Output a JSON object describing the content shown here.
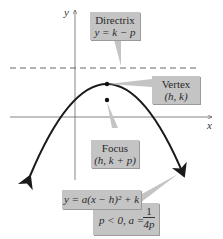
{
  "axes": {
    "x_label": "x",
    "y_label": "y"
  },
  "labels": {
    "directrix": {
      "title": "Directrix",
      "eq": "y = k − p"
    },
    "vertex": {
      "title": "Vertex",
      "coords": "(h, k)"
    },
    "focus": {
      "title": "Focus",
      "coords": "(h, k + p)"
    },
    "equation": {
      "main": "y = a(x − h)² + k"
    },
    "condition": {
      "text": "p < 0, a =",
      "num": "1",
      "den": "4p"
    }
  },
  "colors": {
    "box": "#c4c4c4",
    "curve": "#1a1a1a",
    "axis": "#555555"
  }
}
